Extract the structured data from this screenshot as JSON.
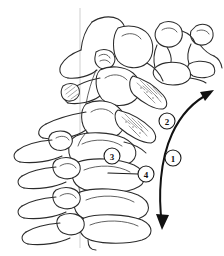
{
  "figure": {
    "background_color": "#ffffff",
    "line_color": "#2b2b2b",
    "reference_line_color": "#c9c9c9",
    "arrow_color": "#111111",
    "callouts": [
      {
        "id": "callout-1",
        "label": "1",
        "cx": 173,
        "cy": 158,
        "r": 8,
        "description": "overall spinal curvature range arrow"
      },
      {
        "id": "callout-2",
        "label": "2",
        "cx": 167,
        "cy": 121,
        "r": 8,
        "description": "posterior element / spinous process region"
      },
      {
        "id": "callout-3",
        "label": "3",
        "cx": 112,
        "cy": 156,
        "r": 8,
        "description": "articular process region"
      },
      {
        "id": "callout-4",
        "label": "4",
        "cx": 146,
        "cy": 174,
        "r": 8,
        "description": "vertebral body, leader line pointing left"
      }
    ],
    "leader_lines": [
      {
        "id": "leader-4",
        "from_x": 138,
        "from_y": 174,
        "to_x": 108,
        "to_y": 173
      }
    ],
    "arrow": {
      "id": "curvature-arrow",
      "double_headed": true,
      "path": "M 162 224 C 158 196, 160 160, 172 134 C 182 112, 196 100, 212 92",
      "head_top": {
        "x": 212,
        "y": 92,
        "angle": -28
      },
      "head_bottom": {
        "x": 162,
        "y": 224,
        "angle": 98
      }
    },
    "reference_line": {
      "x": 80,
      "y1": 8,
      "y2": 248
    }
  }
}
